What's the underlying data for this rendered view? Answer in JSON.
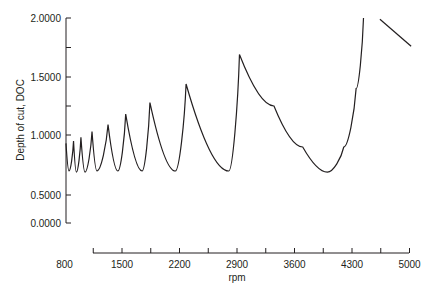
{
  "chart_data": {
    "type": "line",
    "title": "",
    "xlabel": "rpm",
    "ylabel": "Depth of cut, DOC",
    "xlim": [
      800,
      5000
    ],
    "ylim": [
      0,
      2.0
    ],
    "grid": false,
    "legend": null,
    "x_ticks": [
      800,
      1500,
      2200,
      2900,
      3600,
      4300,
      5000
    ],
    "x_tick_labels": [
      "800",
      "1500",
      "2200",
      "2900",
      "3600",
      "4300",
      "5000"
    ],
    "y_ticks": [
      0.0,
      0.5,
      1.0,
      1.5,
      2.0
    ],
    "y_tick_labels": [
      "0.0000",
      "0.5000",
      "1.0000",
      "1.5000",
      "2.0000"
    ],
    "series": [
      {
        "name": "stability limit",
        "color": "#231f20",
        "points": [
          [
            818,
            0.93
          ],
          [
            855,
            0.7
          ],
          [
            910,
            0.95
          ],
          [
            945,
            0.69
          ],
          [
            1000,
            0.98
          ],
          [
            1050,
            0.69
          ],
          [
            1135,
            1.03
          ],
          [
            1195,
            0.7
          ],
          [
            1330,
            1.09
          ],
          [
            1450,
            0.7
          ],
          [
            1545,
            1.18
          ],
          [
            1745,
            0.7
          ],
          [
            1840,
            1.28
          ],
          [
            2150,
            0.7
          ],
          [
            2280,
            1.44
          ],
          [
            2800,
            0.7
          ],
          [
            2930,
            1.69
          ],
          [
            3350,
            1.25
          ],
          [
            3700,
            0.9
          ],
          [
            4000,
            0.69
          ],
          [
            4200,
            0.9
          ],
          [
            4350,
            1.4
          ],
          [
            4440,
            2.0
          ]
        ]
      },
      {
        "name": "stability limit (next lobe, partial)",
        "color": "#231f20",
        "points": [
          [
            4640,
            1.99
          ],
          [
            5020,
            1.76
          ]
        ]
      }
    ]
  }
}
